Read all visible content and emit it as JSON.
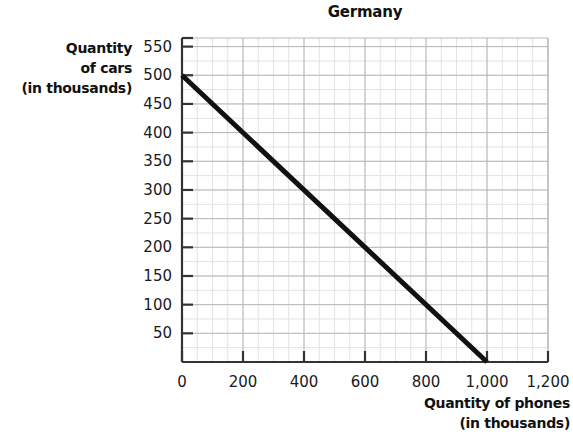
{
  "chart_data": {
    "type": "line",
    "title": "Germany",
    "xlabel_lines": [
      "Quantity of phones",
      "(in thousands)"
    ],
    "ylabel_lines": [
      "Quantity",
      "of cars",
      "(in thousands)"
    ],
    "xlabel": "Quantity of phones (in thousands)",
    "ylabel": "Quantity of cars (in thousands)",
    "xlim": [
      0,
      1200
    ],
    "ylim": [
      0,
      565
    ],
    "xticks": [
      0,
      200,
      400,
      600,
      800,
      1000,
      1200
    ],
    "xtick_labels": [
      "0",
      "200",
      "400",
      "600",
      "800",
      "1,000",
      "1,200"
    ],
    "yticks": [
      50,
      100,
      150,
      200,
      250,
      300,
      350,
      400,
      450,
      500,
      550
    ],
    "ytick_labels": [
      "50",
      "100",
      "150",
      "200",
      "250",
      "300",
      "350",
      "400",
      "450",
      "500",
      "550"
    ],
    "grid": true,
    "grid_minor_x_step": 50,
    "grid_major_x_step": 200,
    "grid_minor_y_step": 25,
    "grid_major_y_step": 50,
    "legend": null,
    "series": [
      {
        "name": "Production possibilities frontier",
        "color": "#111111",
        "line_width": 5,
        "x": [
          0,
          1000
        ],
        "y": [
          500,
          0
        ],
        "points": [
          {
            "x": 0,
            "y": 500
          },
          {
            "x": 200,
            "y": 400
          },
          {
            "x": 400,
            "y": 300
          },
          {
            "x": 600,
            "y": 200
          },
          {
            "x": 800,
            "y": 100
          },
          {
            "x": 1000,
            "y": 0
          }
        ]
      }
    ]
  },
  "colors": {
    "axis": "#333333",
    "grid_major": "#b8b8b8",
    "grid_minor": "#e2e2e2",
    "line": "#111111",
    "text": "#111111",
    "background": "#ffffff"
  }
}
